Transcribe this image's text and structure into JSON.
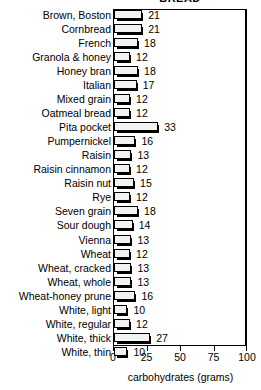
{
  "chart_data": {
    "type": "bar",
    "orientation": "horizontal",
    "title": "BREAD",
    "xlabel": "carbohydrates (grams)",
    "ylabel": "",
    "xlim": [
      0,
      100
    ],
    "xticks": [
      0,
      25,
      50,
      75,
      100
    ],
    "grid": false,
    "legend": null,
    "value_labels": true,
    "categories": [
      "Brown, Boston",
      "Cornbread",
      "French",
      "Granola & honey",
      "Honey bran",
      "Italian",
      "Mixed grain",
      "Oatmeal bread",
      "Pita pocket",
      "Pumpernickel",
      "Raisin",
      "Raisin cinnamon",
      "Raisin nut",
      "Rye",
      "Seven grain",
      "Sour dough",
      "Vienna",
      "Wheat",
      "Wheat, cracked",
      "Wheat, whole",
      "Wheat-honey prune",
      "White, light",
      "White, regular",
      "White, thick",
      "White, thin"
    ],
    "values": [
      21,
      21,
      18,
      12,
      18,
      17,
      12,
      12,
      33,
      16,
      13,
      12,
      15,
      12,
      18,
      14,
      13,
      12,
      13,
      13,
      16,
      10,
      12,
      27,
      10
    ]
  },
  "axis": {
    "tick_labels": [
      "0",
      "25",
      "50",
      "75",
      "100"
    ],
    "title": "carbohydrates (grams)"
  },
  "colors": {
    "bar_face": "#f2f2f2",
    "bar_outline": "#000000",
    "bar_shadow": "#000000",
    "frame": "#000000",
    "text": "#000000",
    "background": "#ffffff"
  }
}
